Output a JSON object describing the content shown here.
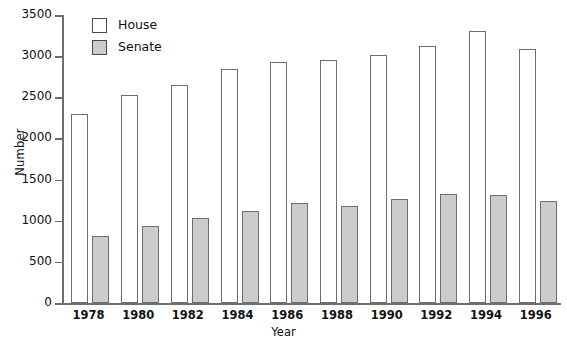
{
  "chart_data": {
    "type": "bar",
    "title": "",
    "xlabel": "Year",
    "ylabel": "Number",
    "categories": [
      "1978",
      "1980",
      "1982",
      "1984",
      "1986",
      "1988",
      "1990",
      "1992",
      "1994",
      "1996"
    ],
    "series": [
      {
        "name": "House",
        "color": "#ffffff",
        "values": [
          2300,
          2530,
          2650,
          2850,
          2930,
          2950,
          3010,
          3120,
          3300,
          3090
        ]
      },
      {
        "name": "Senate",
        "color": "#cccccc",
        "values": [
          810,
          940,
          1030,
          1120,
          1210,
          1180,
          1260,
          1330,
          1310,
          1240
        ]
      }
    ],
    "ylim": [
      0,
      3500
    ],
    "yticks": [
      0,
      500,
      1000,
      1500,
      2000,
      2500,
      3000,
      3500
    ],
    "ytick_labels": [
      "0",
      "500",
      "1000",
      "1500",
      "2000",
      "2500",
      "3000",
      "3500"
    ],
    "grid": false,
    "legend_position": "top-left"
  },
  "legend": {
    "items": [
      {
        "label": "House"
      },
      {
        "label": "Senate"
      }
    ]
  },
  "axes": {
    "y_title": "Number",
    "x_title": "Year"
  }
}
